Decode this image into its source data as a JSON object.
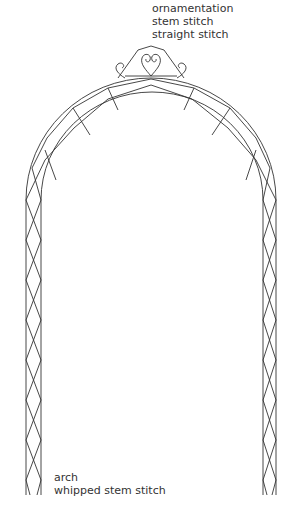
{
  "labels": {
    "top": {
      "line1": "ornamentation",
      "line2": "stem stitch",
      "line3": "straight stitch"
    },
    "bottom": {
      "line1": "arch",
      "line2": "whipped stem stitch"
    }
  },
  "colors": {
    "stroke": "#333333",
    "text": "#333333"
  }
}
